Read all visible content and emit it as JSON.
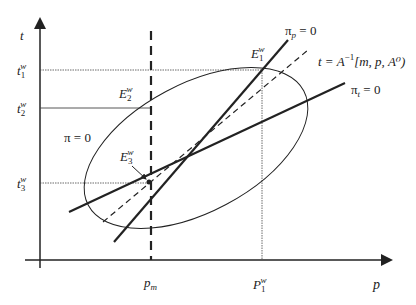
{
  "axes": {
    "x_label": "p",
    "y_label": "t"
  },
  "y_ticks": {
    "t1": {
      "base": "t",
      "sub": "1",
      "sup": "w"
    },
    "t2": {
      "base": "t",
      "sub": "2",
      "sup": "w"
    },
    "t3": {
      "base": "t",
      "sub": "3",
      "sup": "w"
    }
  },
  "x_ticks": {
    "pm": {
      "base": "p",
      "sub": "m"
    },
    "p1": {
      "base": "P",
      "sub": "1",
      "sup": "w"
    }
  },
  "points": {
    "e1": {
      "base": "E",
      "sub": "1",
      "sup": "w"
    },
    "e2": {
      "base": "E",
      "sub": "2",
      "sup": "w"
    },
    "e3": {
      "base": "E",
      "sub": "3",
      "sup": "w"
    }
  },
  "curves": {
    "pi_p": {
      "base": "π",
      "sub": "p",
      "rest": " = 0"
    },
    "pi_t": {
      "base": "π",
      "sub": "t",
      "rest": " = 0"
    },
    "pi_zero": "π = 0",
    "a_inverse": {
      "pre": "t = A",
      "sup": "−1",
      "post": "[m, p, A⁰)"
    }
  },
  "colors": {
    "ink": "#222222",
    "background": "#ffffff"
  }
}
